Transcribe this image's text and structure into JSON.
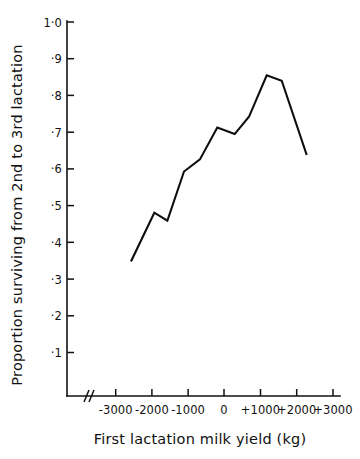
{
  "chart_data": {
    "type": "line",
    "title": "",
    "xlabel": "First lactation milk yield (kg)",
    "ylabel": "Proportion surviving from 2nd to 3rd lactation",
    "xlim": [
      -3500,
      3500
    ],
    "ylim": [
      0.0,
      1.0
    ],
    "grid": false,
    "legend": "none",
    "axis_break": {
      "present": true,
      "symbol": "//",
      "axis": "x",
      "position_value": -3450,
      "note": "double slash break mark on x-axis near origin corner"
    },
    "x_ticks": [
      -3000,
      -2000,
      -1000,
      0,
      1000,
      2000,
      3000
    ],
    "x_tick_labels": [
      "-3000",
      "-2000",
      "-1000",
      "0",
      "+1000",
      "+2000",
      "+3000"
    ],
    "y_ticks": [
      0.1,
      0.2,
      0.3,
      0.4,
      0.5,
      0.6,
      0.7,
      0.8,
      0.9,
      1.0
    ],
    "y_tick_labels": [
      "·1",
      "·2",
      "·3",
      "·4",
      "·5",
      "·6",
      "·7",
      "·8",
      "·9",
      "1·0"
    ],
    "series": [
      {
        "name": "Proportion surviving 2nd to 3rd lactation",
        "color": "#0d0d0d",
        "x": [
          -2570,
          -1925,
          -1565,
          -1105,
          -665,
          -185,
          295,
          690,
          1180,
          1595,
          2285
        ],
        "y": [
          0.348,
          0.481,
          0.459,
          0.593,
          0.626,
          0.713,
          0.695,
          0.742,
          0.855,
          0.84,
          0.638
        ]
      }
    ],
    "points_readable": [
      {
        "x": -2570,
        "y": 0.348
      },
      {
        "x": -1925,
        "y": 0.481
      },
      {
        "x": -1565,
        "y": 0.459
      },
      {
        "x": -1105,
        "y": 0.593
      },
      {
        "x": -665,
        "y": 0.626
      },
      {
        "x": -185,
        "y": 0.713
      },
      {
        "x": 295,
        "y": 0.695
      },
      {
        "x": 690,
        "y": 0.742
      },
      {
        "x": 1180,
        "y": 0.855
      },
      {
        "x": 1595,
        "y": 0.84
      },
      {
        "x": 2285,
        "y": 0.638
      }
    ]
  },
  "figure": {
    "background_color": "#ffffff",
    "line_color": "#0d0d0d",
    "axis_color": "#111111"
  }
}
